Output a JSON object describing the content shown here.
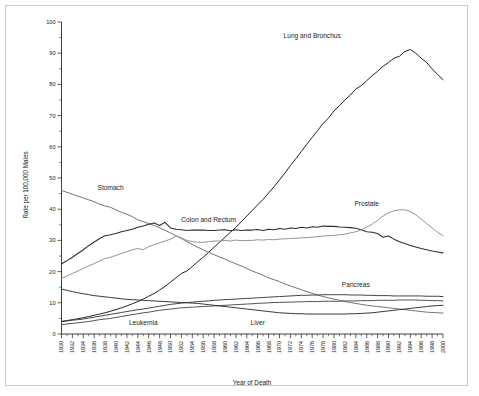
{
  "figure": {
    "ylabel": "Rate per 100,000 Males",
    "xlabel": "Year of Death",
    "background": "#ffffff",
    "axis_color": "#2b2b2b"
  },
  "chart_data": {
    "type": "line",
    "title": "",
    "subtitle": "",
    "xlabel": "Year of Death",
    "ylabel": "Rate per 100,000 Males",
    "xlim": [
      1930,
      2000
    ],
    "ylim": [
      0,
      100
    ],
    "yticks": [
      0,
      10,
      20,
      30,
      40,
      50,
      60,
      70,
      80,
      90,
      100
    ],
    "ytick_labels": [
      "0",
      "10",
      "20",
      "30",
      "40",
      "50",
      "60",
      "70",
      "80",
      "90",
      "100"
    ],
    "xticks": [
      1930,
      1932,
      1934,
      1936,
      1938,
      1940,
      1942,
      1944,
      1946,
      1948,
      1950,
      1952,
      1954,
      1956,
      1958,
      1960,
      1962,
      1964,
      1966,
      1968,
      1970,
      1972,
      1974,
      1976,
      1978,
      1980,
      1982,
      1984,
      1986,
      1988,
      1990,
      1992,
      1994,
      1996,
      1998,
      2000
    ],
    "xtick_labels": [
      "1930",
      "1932",
      "1934",
      "1936",
      "1938",
      "1940",
      "1942",
      "1944",
      "1946",
      "1948",
      "1950",
      "1952",
      "1954",
      "1956",
      "1958",
      "1960",
      "1962",
      "1964",
      "1966",
      "1968",
      "1970",
      "1972",
      "1974",
      "1976",
      "1978",
      "1980",
      "1982",
      "1984",
      "1986",
      "1988",
      "1990",
      "1992",
      "1994",
      "1996",
      "1998",
      "2000"
    ],
    "xtick_minor_step": 1,
    "grid": false,
    "legend": "inline-annotations",
    "x": [
      1930,
      1931,
      1932,
      1933,
      1934,
      1935,
      1936,
      1937,
      1938,
      1939,
      1940,
      1941,
      1942,
      1943,
      1944,
      1945,
      1946,
      1947,
      1948,
      1949,
      1950,
      1951,
      1952,
      1953,
      1954,
      1955,
      1956,
      1957,
      1958,
      1959,
      1960,
      1961,
      1962,
      1963,
      1964,
      1965,
      1966,
      1967,
      1968,
      1969,
      1970,
      1971,
      1972,
      1973,
      1974,
      1975,
      1976,
      1977,
      1978,
      1979,
      1980,
      1981,
      1982,
      1983,
      1984,
      1985,
      1986,
      1987,
      1988,
      1989,
      1990,
      1991,
      1992,
      1993,
      1994,
      1995,
      1996,
      1997,
      1998,
      1999,
      2000
    ],
    "series": [
      {
        "name": "Lung and Bronchus",
        "color": "#222222",
        "width": 1.0,
        "label_x": 1976,
        "label_y": 95,
        "values": [
          4.0,
          4.3,
          4.6,
          4.9,
          5.2,
          5.6,
          6.0,
          6.4,
          6.8,
          7.3,
          7.8,
          8.4,
          9.0,
          9.7,
          10.4,
          11.2,
          12.1,
          13.0,
          14.1,
          15.3,
          16.6,
          18.0,
          19.4,
          20.2,
          21.6,
          23.2,
          24.6,
          26.2,
          27.8,
          29.4,
          31.0,
          32.6,
          34.2,
          36.0,
          37.8,
          39.6,
          41.4,
          43.2,
          45.2,
          47.2,
          49.4,
          51.6,
          54.0,
          56.2,
          58.5,
          60.8,
          63.0,
          65.2,
          67.5,
          69.2,
          71.5,
          73.2,
          75.0,
          76.6,
          78.5,
          79.6,
          81.2,
          82.8,
          84.2,
          85.8,
          87.0,
          88.4,
          89.0,
          90.5,
          91.2,
          90.0,
          88.4,
          87.0,
          85.0,
          83.2,
          81.5
        ]
      },
      {
        "name": "Stomach",
        "color": "#6b6b6b",
        "width": 0.95,
        "label_x": 1939,
        "label_y": 46,
        "values": [
          46.0,
          45.4,
          44.8,
          44.2,
          43.6,
          43.0,
          42.4,
          41.6,
          41.0,
          40.6,
          39.8,
          39.0,
          38.4,
          37.6,
          36.6,
          36.0,
          35.4,
          34.8,
          34.0,
          33.2,
          32.4,
          31.5,
          30.6,
          29.6,
          28.7,
          27.8,
          27.0,
          26.2,
          25.4,
          24.7,
          24.0,
          23.2,
          22.5,
          21.8,
          21.0,
          20.2,
          19.5,
          18.8,
          18.0,
          17.4,
          16.8,
          16.0,
          15.4,
          14.8,
          14.2,
          13.6,
          13.0,
          12.5,
          12.0,
          11.6,
          11.2,
          10.8,
          10.4,
          10.1,
          9.8,
          9.5,
          9.2,
          9.0,
          8.8,
          8.6,
          8.4,
          8.2,
          8.0,
          7.8,
          7.6,
          7.4,
          7.2,
          7.0,
          6.9,
          6.8,
          6.7
        ]
      },
      {
        "name": "Colon and Rectum",
        "color": "#2e2e2e",
        "width": 1.05,
        "label_x": 1957,
        "label_y": 36,
        "values": [
          22.5,
          23.5,
          24.6,
          25.8,
          27.0,
          28.3,
          29.5,
          30.6,
          31.5,
          31.8,
          32.2,
          32.8,
          33.2,
          33.6,
          34.2,
          34.6,
          35.2,
          35.6,
          34.8,
          35.8,
          34.0,
          33.6,
          33.4,
          33.2,
          33.3,
          33.3,
          33.3,
          33.2,
          33.2,
          33.3,
          33.4,
          33.1,
          33.4,
          33.2,
          33.3,
          33.3,
          33.5,
          33.2,
          33.6,
          33.4,
          33.8,
          33.6,
          34.0,
          33.8,
          34.2,
          34.0,
          34.4,
          34.2,
          34.6,
          34.5,
          34.5,
          34.3,
          34.2,
          34.1,
          33.9,
          33.4,
          32.8,
          32.6,
          32.2,
          31.0,
          31.4,
          30.4,
          29.6,
          29.0,
          28.4,
          27.9,
          27.4,
          27.0,
          26.6,
          26.3,
          26.0
        ]
      },
      {
        "name": "Prostate",
        "color": "#8d8d8d",
        "width": 0.95,
        "label_x": 1986,
        "label_y": 41,
        "values": [
          17.8,
          18.6,
          19.4,
          20.2,
          21.0,
          21.8,
          22.6,
          23.4,
          24.2,
          24.6,
          25.2,
          25.8,
          26.4,
          27.0,
          27.4,
          27.0,
          28.0,
          28.6,
          29.2,
          29.8,
          30.4,
          31.4,
          30.8,
          30.0,
          29.6,
          29.4,
          29.4,
          29.6,
          29.8,
          29.8,
          30.0,
          29.8,
          30.1,
          29.9,
          30.0,
          30.0,
          30.2,
          30.1,
          30.3,
          30.2,
          30.4,
          30.5,
          30.6,
          30.7,
          30.8,
          30.9,
          31.0,
          31.2,
          31.4,
          31.5,
          31.6,
          31.8,
          32.0,
          32.4,
          32.8,
          33.4,
          34.2,
          35.2,
          36.4,
          37.8,
          38.8,
          39.5,
          39.8,
          39.8,
          39.2,
          38.2,
          36.8,
          35.4,
          34.0,
          32.6,
          31.5
        ]
      },
      {
        "name": "Pancreas",
        "color": "#3a3a3a",
        "width": 0.95,
        "label_x": 1984,
        "label_y": 15,
        "values": [
          4.0,
          4.2,
          4.4,
          4.6,
          4.8,
          5.1,
          5.4,
          5.7,
          6.0,
          6.3,
          6.6,
          6.9,
          7.2,
          7.5,
          7.8,
          8.0,
          8.3,
          8.6,
          8.9,
          9.2,
          9.5,
          9.7,
          9.9,
          10.1,
          10.2,
          10.4,
          10.5,
          10.6,
          10.8,
          10.9,
          11.0,
          11.1,
          11.2,
          11.3,
          11.4,
          11.5,
          11.6,
          11.7,
          11.8,
          11.9,
          12.0,
          12.1,
          12.2,
          12.3,
          12.4,
          12.4,
          12.5,
          12.5,
          12.6,
          12.6,
          12.6,
          12.6,
          12.6,
          12.5,
          12.5,
          12.5,
          12.4,
          12.4,
          12.3,
          12.3,
          12.3,
          12.2,
          12.2,
          12.2,
          12.2,
          12.2,
          12.2,
          12.1,
          12.1,
          12.1,
          12.0
        ]
      },
      {
        "name": "Leukemia",
        "color": "#4a4a4a",
        "width": 0.95,
        "label_x": 1945,
        "label_y": 2.8,
        "values": [
          3.0,
          3.2,
          3.4,
          3.6,
          3.8,
          4.0,
          4.3,
          4.6,
          4.8,
          5.0,
          5.3,
          5.6,
          5.9,
          6.2,
          6.5,
          6.8,
          7.0,
          7.3,
          7.6,
          7.8,
          8.0,
          8.2,
          8.4,
          8.5,
          8.6,
          8.7,
          8.8,
          8.9,
          9.0,
          9.1,
          9.2,
          9.3,
          9.4,
          9.5,
          9.6,
          9.7,
          9.8,
          9.9,
          10.0,
          10.1,
          10.1,
          10.2,
          10.2,
          10.3,
          10.3,
          10.4,
          10.4,
          10.4,
          10.5,
          10.5,
          10.5,
          10.5,
          10.6,
          10.6,
          10.6,
          10.7,
          10.7,
          10.7,
          10.8,
          10.8,
          10.8,
          10.8,
          10.9,
          10.9,
          10.9,
          10.9,
          10.8,
          10.8,
          10.7,
          10.7,
          10.6
        ]
      },
      {
        "name": "Liver",
        "color": "#2e2e2e",
        "width": 0.95,
        "label_x": 1966,
        "label_y": 3.0,
        "values": [
          14.4,
          14.0,
          13.6,
          13.2,
          12.9,
          12.6,
          12.3,
          12.1,
          11.9,
          11.7,
          11.5,
          11.3,
          11.1,
          11.0,
          10.9,
          10.8,
          10.7,
          10.6,
          10.5,
          10.4,
          10.3,
          10.2,
          10.1,
          10.0,
          9.9,
          9.8,
          9.6,
          9.4,
          9.2,
          9.0,
          8.8,
          8.6,
          8.4,
          8.2,
          8.0,
          7.8,
          7.6,
          7.4,
          7.2,
          7.0,
          6.8,
          6.7,
          6.6,
          6.5,
          6.5,
          6.4,
          6.4,
          6.4,
          6.4,
          6.4,
          6.4,
          6.4,
          6.4,
          6.5,
          6.5,
          6.6,
          6.7,
          6.8,
          7.0,
          7.2,
          7.4,
          7.6,
          7.8,
          8.0,
          8.2,
          8.4,
          8.6,
          8.8,
          9.0,
          9.1,
          9.2
        ]
      }
    ]
  }
}
